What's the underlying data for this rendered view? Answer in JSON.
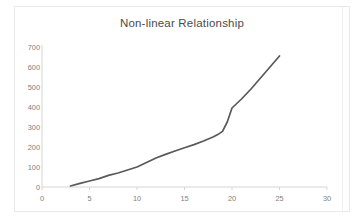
{
  "chart_data": {
    "type": "line",
    "title": "Non-linear Relationship",
    "xlabel": "",
    "ylabel": "",
    "xlim": [
      0,
      30
    ],
    "ylim": [
      0,
      700
    ],
    "xticks": [
      0,
      5,
      10,
      15,
      20,
      25,
      30
    ],
    "yticks": [
      0,
      100,
      200,
      300,
      400,
      500,
      600,
      700
    ],
    "grid": false,
    "legend": false,
    "legend_position": "none",
    "series": [
      {
        "name": "y",
        "color": "#595959",
        "x": [
          3,
          4,
          5,
          6,
          7,
          8,
          9,
          10,
          11,
          12,
          13,
          14,
          15,
          16,
          17,
          18,
          18.5,
          19,
          19.5,
          20,
          21,
          22,
          23,
          24,
          25
        ],
        "values": [
          5,
          18,
          30,
          42,
          58,
          70,
          85,
          100,
          122,
          145,
          163,
          180,
          196,
          212,
          230,
          250,
          262,
          278,
          325,
          395,
          440,
          490,
          545,
          600,
          655
        ]
      }
    ]
  },
  "axis": {
    "y_tick_labels": [
      "700",
      "600",
      "500",
      "400",
      "300",
      "200",
      "100",
      "0"
    ],
    "x_tick_labels": [
      "0",
      "5",
      "10",
      "15",
      "20",
      "25",
      "30"
    ]
  },
  "colors": {
    "series": "#595959",
    "axis": "#d0d0d0",
    "tick_text": "#808080",
    "title_text": "#4a4a4a",
    "frame_border": "#e9e9e9",
    "background": "#ffffff"
  }
}
